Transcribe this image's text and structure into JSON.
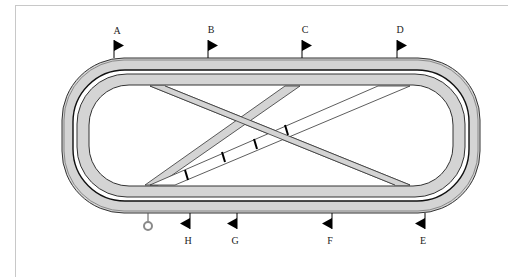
{
  "diagram": {
    "colors": {
      "track_fill": "#d4d4d4",
      "track_edge": "#333333",
      "rail": "#111111",
      "flag": "#000000",
      "marker_ring": "#8a8a8a",
      "frame": "#c8c8c8"
    },
    "flags_top": [
      {
        "label": "A",
        "x": 114
      },
      {
        "label": "B",
        "x": 208
      },
      {
        "label": "C",
        "x": 302
      },
      {
        "label": "D",
        "x": 397
      }
    ],
    "flags_bottom": [
      {
        "label": "H",
        "x": 190
      },
      {
        "label": "G",
        "x": 237
      },
      {
        "label": "F",
        "x": 332
      },
      {
        "label": "E",
        "x": 425
      }
    ],
    "start_marker": {
      "name": "winning-post-ring",
      "x": 148
    },
    "furlong_ticks": 4
  }
}
